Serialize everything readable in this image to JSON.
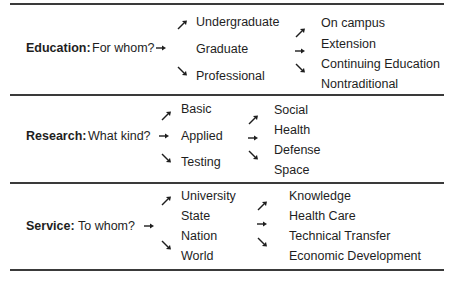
{
  "sections": [
    {
      "category": "Education:",
      "question": "For whom?",
      "column1": [
        "Undergraduate",
        "Graduate",
        "Professional"
      ],
      "column2": [
        "On campus",
        "Extension",
        "Continuing Education",
        "Nontraditional"
      ]
    },
    {
      "category": "Research:",
      "question": "What kind?",
      "column1": [
        "Basic",
        "Applied",
        "Testing"
      ],
      "column2": [
        "Social",
        "Health",
        "Defense",
        "Space"
      ]
    },
    {
      "category": "Service:",
      "question": "To whom?",
      "column1": [
        "University",
        "State",
        "Nation",
        "World"
      ],
      "column2": [
        "Knowledge",
        "Health Care",
        "Technical Transfer",
        "Economic Development"
      ]
    }
  ],
  "icons": {
    "arrow_right": "arrow-right-icon",
    "arrow_up_right": "arrow-up-right-icon",
    "arrow_down_right": "arrow-down-right-icon"
  },
  "colors": {
    "text": "#1e1e1e",
    "rule": "#3a3a3a"
  }
}
